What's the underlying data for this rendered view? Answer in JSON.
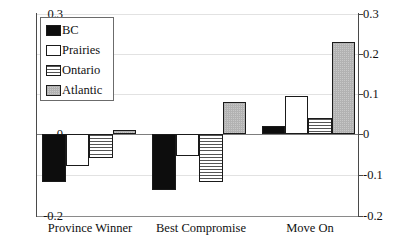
{
  "chart_data": {
    "type": "bar",
    "title": "",
    "xlabel": "",
    "ylabel": "",
    "categories": [
      "Province Winner",
      "Best Compromise",
      "Move On"
    ],
    "series": [
      {
        "name": "BC",
        "pattern": "solid-black",
        "values": [
          -0.12,
          -0.14,
          0.02
        ]
      },
      {
        "name": "Prairies",
        "pattern": "white-empty",
        "values": [
          -0.08,
          -0.055,
          0.095
        ]
      },
      {
        "name": "Ontario",
        "pattern": "horizontal-lines",
        "values": [
          -0.06,
          -0.12,
          0.04
        ]
      },
      {
        "name": "Atlantic",
        "pattern": "dotted-gray",
        "values": [
          0.01,
          0.08,
          0.228
        ]
      }
    ],
    "ylim": [
      -0.2,
      0.3
    ],
    "yticks": [
      0.3,
      0.2,
      0.1,
      0,
      -0.1,
      -0.2
    ],
    "ytick_labels_left": [
      "0.3",
      "0.2",
      "0.1",
      "0",
      "-0.1",
      "-0.2"
    ],
    "ytick_labels_right": [
      "0.3",
      "0.2",
      "0.1",
      "0",
      "-0.1",
      "-0.2"
    ],
    "grid": true,
    "legend_position": "top-left",
    "legend_entries": [
      "BC",
      "Prairies",
      "Ontario",
      "Atlantic"
    ],
    "colors": {
      "bar_outline": "#1a1a1a",
      "bc": "#0d0d0d",
      "prairies": "#ffffff",
      "ontario": "#ffffff",
      "atlantic": "#c8c8c8",
      "axis": "#4a4a4a",
      "gridline": "#e2e2e2",
      "background": "#ffffff"
    }
  }
}
